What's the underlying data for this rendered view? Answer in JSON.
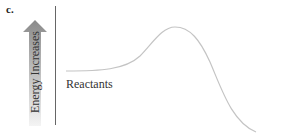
{
  "diagram": {
    "panel_label": "c.",
    "axis_label": "Energy Increases",
    "curve_label": "Reactants",
    "colors": {
      "curve": "#c4c4c4",
      "axis": "#666666",
      "arrow_top": "#8a8a8a",
      "arrow_bottom": "#f2f2f2"
    },
    "curve_type": "energy-profile-exothermic",
    "curve_points": [
      {
        "x": 66,
        "y": 71
      },
      {
        "x": 130,
        "y": 68
      },
      {
        "x": 175,
        "y": 27
      },
      {
        "x": 255,
        "y": 130
      }
    ]
  }
}
